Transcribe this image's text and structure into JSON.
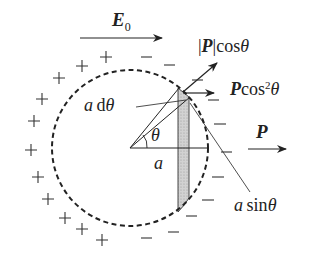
{
  "diagram": {
    "labels": {
      "field": "E",
      "field_sub": "0",
      "p_abs_cos": "|P|cosθ",
      "p_abs_cos_parts": {
        "bar_open": "|",
        "vec": "P",
        "bar_close": "|",
        "func": "cos",
        "var": "θ"
      },
      "p_cos2": {
        "vec": "P",
        "func": "cos",
        "sup": "2",
        "var": "θ"
      },
      "p": "P",
      "a_dtheta": {
        "a": "a",
        "d": "d",
        "var": "θ"
      },
      "theta": "θ",
      "a": "a",
      "a_sin": {
        "a": "a",
        "func": "sin",
        "var": "θ"
      }
    },
    "charges": {
      "positive_symbol": "+",
      "negative_symbol": "−",
      "positive_count": 16,
      "negative_count": 14
    },
    "colors": {
      "ink": "#222222",
      "strip_fill": "#c8c8c8",
      "background": "#ffffff"
    }
  }
}
